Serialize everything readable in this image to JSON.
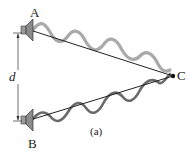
{
  "diagram": {
    "labels": {
      "source_a": "A",
      "source_b": "B",
      "point_c": "C",
      "separation": "d",
      "caption": "(a)"
    },
    "colors": {
      "wave_a": "#a9a9a9",
      "wave_b": "#6a6a6a",
      "line": "#222222",
      "speaker": "#8a8a8a"
    }
  }
}
